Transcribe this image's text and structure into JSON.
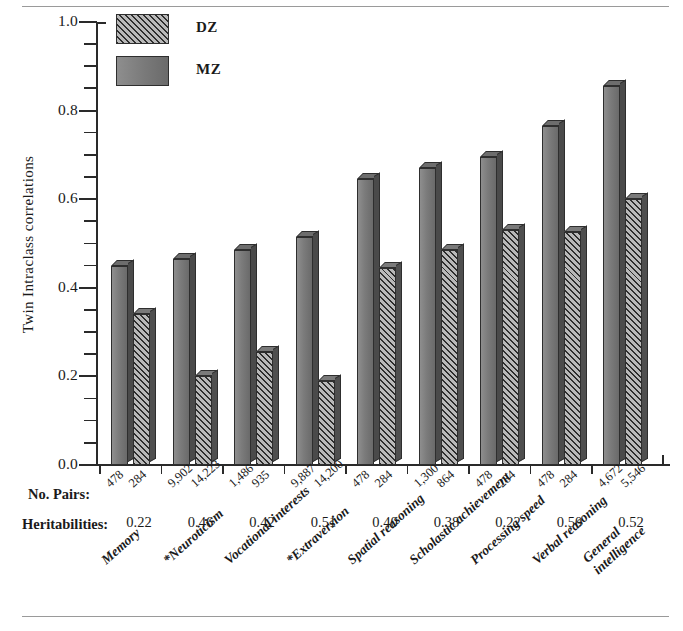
{
  "chart_data": {
    "type": "bar",
    "title": "",
    "xlabel": "",
    "ylabel": "Twin Intraclass correlations",
    "ylim": [
      0.0,
      1.0
    ],
    "ytick_labels": [
      "0.0",
      "0.2",
      "0.4",
      "0.6",
      "0.8",
      "1.0"
    ],
    "ytick_values": [
      0.0,
      0.2,
      0.4,
      0.6,
      0.8,
      1.0
    ],
    "minor_tick_step": 0.05,
    "grid": false,
    "legend_position": "top-left",
    "categories": [
      "Memory",
      "*Neuroticism",
      "Vocational interests",
      "*Extraversion",
      "Spatial reasoning",
      "Scholastic achievement",
      "Processing speed",
      "Verbal reasoning",
      "General intelligence"
    ],
    "series": [
      {
        "name": "MZ",
        "values": [
          0.45,
          0.465,
          0.485,
          0.515,
          0.645,
          0.67,
          0.695,
          0.765,
          0.855
        ]
      },
      {
        "name": "DZ",
        "values": [
          0.34,
          0.2,
          0.255,
          0.19,
          0.445,
          0.485,
          0.53,
          0.525,
          0.6
        ]
      }
    ],
    "annotations": {
      "pairs_row_label": "No. Pairs:",
      "heritabilities_row_label": "Heritabilities:",
      "pairs_mz": [
        "478",
        "9,902",
        "1,486",
        "9,887",
        "478",
        "1,300",
        "478",
        "478",
        "4,672"
      ],
      "pairs_dz": [
        "284",
        "14,223",
        "935",
        "14,200",
        "284",
        "864",
        "284",
        "284",
        "5,546"
      ],
      "heritabilities": [
        "0.22",
        "0.46",
        "0.42",
        "0.51",
        "0.40",
        "0.38",
        "0.22",
        "0.50",
        "0.52"
      ]
    },
    "legend": [
      {
        "label": "DZ",
        "swatch": "hatched-diagonal"
      },
      {
        "label": "MZ",
        "swatch": "solid-gray"
      }
    ],
    "colors": {
      "mz_fill": "#7b7b7b",
      "dz_fill": "#b9b9b9",
      "hatch_stroke": "#2e2e2e",
      "axis": "#2a2a2a",
      "text": "#1a1a1a",
      "rule": "#9a9a9a"
    }
  }
}
